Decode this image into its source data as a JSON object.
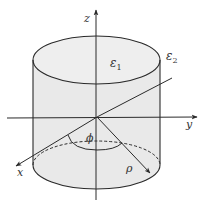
{
  "diagram": {
    "labels": {
      "z_axis": "z",
      "y_axis": "y",
      "x_axis": "x",
      "inner_medium": "ε",
      "inner_medium_sub": "1",
      "outer_medium": "ε",
      "outer_medium_sub": "2",
      "azimuth": "ϕ",
      "radial": "ρ"
    },
    "colors": {
      "cylinder_fill": "#e9e9e9",
      "line": "#2a2a2a"
    }
  }
}
